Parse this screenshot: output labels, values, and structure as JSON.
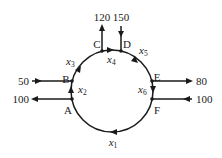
{
  "diagram": {
    "type": "traffic-flow-network",
    "nodes": [
      {
        "id": "A",
        "label": "A"
      },
      {
        "id": "B",
        "label": "B"
      },
      {
        "id": "C",
        "label": "C"
      },
      {
        "id": "D",
        "label": "D"
      },
      {
        "id": "E",
        "label": "E"
      },
      {
        "id": "F",
        "label": "F"
      }
    ],
    "edges": [
      {
        "from": "F",
        "to": "A",
        "var": "x",
        "sub": "1"
      },
      {
        "from": "A",
        "to": "B",
        "var": "x",
        "sub": "2"
      },
      {
        "from": "B",
        "to": "C",
        "var": "x",
        "sub": "3"
      },
      {
        "from": "C",
        "to": "D",
        "var": "x",
        "sub": "4"
      },
      {
        "from": "D",
        "to": "E",
        "var": "x",
        "sub": "5"
      },
      {
        "from": "E",
        "to": "F",
        "var": "x",
        "sub": "6"
      }
    ],
    "external_flows": {
      "A_out": {
        "node": "A",
        "direction": "out",
        "value": "100"
      },
      "B_in": {
        "node": "B",
        "direction": "in",
        "value": "50"
      },
      "C_out": {
        "node": "C",
        "direction": "out",
        "value": "120"
      },
      "D_in": {
        "node": "D",
        "direction": "in",
        "value": "150"
      },
      "E_out": {
        "node": "E",
        "direction": "out",
        "value": "80"
      },
      "F_in": {
        "node": "F",
        "direction": "in",
        "value": "100"
      }
    }
  }
}
